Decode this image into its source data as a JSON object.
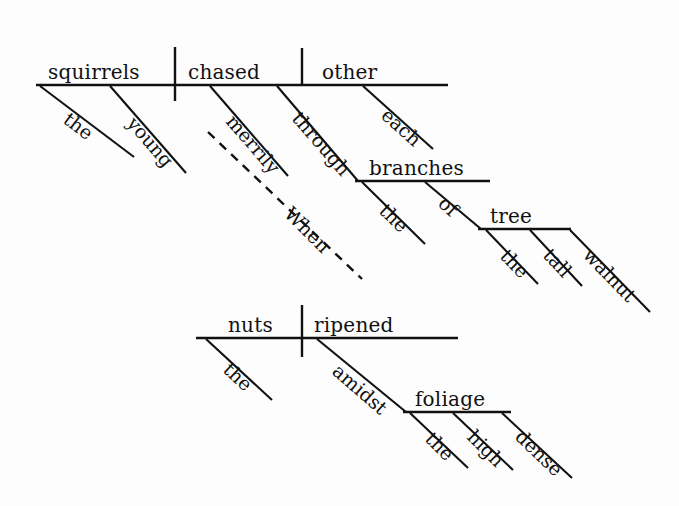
{
  "diagram": {
    "type": "reed-kellogg-sentence-diagram",
    "sentence": "When the nuts ripened amidst the high dense foliage, the young squirrels chased each other merrily through the branches of the tall walnut tree.",
    "ink_color": "#111111",
    "background_color": "#fdfdfd",
    "clauses": [
      {
        "id": "main-clause",
        "role": "independent clause",
        "subject": "squirrels",
        "verb": "chased",
        "direct_object": "other"
      },
      {
        "id": "subordinate-clause",
        "role": "subordinate adverb clause",
        "subject": "nuts",
        "verb": "ripened",
        "connector": "When"
      }
    ],
    "words": {
      "main_subject": "squirrels",
      "main_verb": "chased",
      "main_object": "other",
      "main_subject_article": "the",
      "main_subject_adjective": "young",
      "object_modifier": "each",
      "verb_adverb": "merrily",
      "preposition_1": "through",
      "prep1_object": "branches",
      "prep1_object_article": "the",
      "preposition_2": "of",
      "prep2_object": "tree",
      "prep2_object_article": "the",
      "prep2_adjective_1": "tall",
      "prep2_adjective_2": "walnut",
      "connector": "When",
      "sub_subject": "nuts",
      "sub_verb": "ripened",
      "sub_subject_article": "the",
      "preposition_3": "amidst",
      "prep3_object": "foliage",
      "prep3_object_article": "the",
      "prep3_adjective_1": "high",
      "prep3_adjective_2": "dense"
    }
  }
}
